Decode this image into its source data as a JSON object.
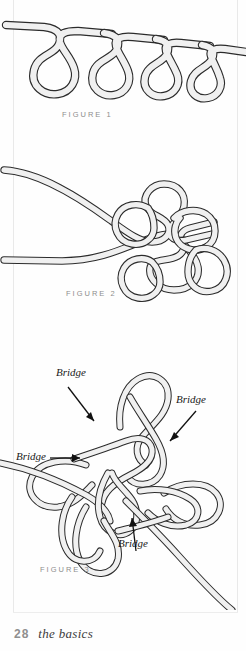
{
  "page": {
    "folio": "28",
    "running_head": "the basics",
    "background_color": "#ffffff",
    "rope_fill_color": "#f0f0f0",
    "rope_outline_color": "#2b2b2b",
    "label_color": "#1a1a1a",
    "caption_color": "#8d8d8d"
  },
  "figures": [
    {
      "id": "figure-1",
      "caption": "FIGURE 1",
      "description": "A single cord running horizontally with four pendant teardrop loops hanging below it",
      "loop_count": 4
    },
    {
      "id": "figure-2",
      "caption": "FIGURE 2",
      "description": "Two cord ends entering from the left and crossing, forming a loose knot with four loops arranged around a central crossing",
      "loop_count": 4
    },
    {
      "id": "figure-3",
      "caption": "FIGURE 3",
      "description": "A tightened decorative knot with four bridge crossings labelled, one cord tail exiting left and one exiting lower right",
      "loop_count": 5
    }
  ],
  "annotations": {
    "bridge_labels": [
      {
        "text": "Bridge",
        "position": "upper-left",
        "x": 56,
        "y": 366
      },
      {
        "text": "Bridge",
        "position": "upper-right",
        "x": 176,
        "y": 393
      },
      {
        "text": "Bridge",
        "position": "mid-left",
        "x": 16,
        "y": 458
      },
      {
        "text": "Bridge",
        "position": "lower-center",
        "x": 118,
        "y": 537
      }
    ]
  }
}
